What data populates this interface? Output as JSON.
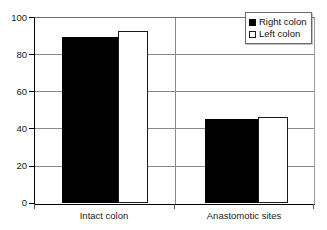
{
  "chart_data": {
    "type": "bar",
    "title": "",
    "xlabel": "",
    "ylabel": "",
    "categories": [
      "Intact colon",
      "Anastomotic sites"
    ],
    "series": [
      {
        "name": "Right colon",
        "color": "#000000",
        "fill": "solid-black",
        "values": [
          89,
          45
        ]
      },
      {
        "name": "Left colon",
        "color": "#ffffff",
        "fill": "white-outlined",
        "values": [
          92.5,
          46.5
        ]
      }
    ],
    "ylim": [
      0,
      100
    ],
    "yticks": [
      0,
      20,
      40,
      60,
      80,
      100
    ],
    "ytick_labels": [
      "0",
      "20",
      "40",
      "60",
      "80",
      "100"
    ],
    "grid": "horizontal",
    "legend_position": "top-right",
    "legend_entries": [
      "Right colon",
      "Left colon"
    ]
  },
  "axes": {
    "y_labels": [
      "100",
      "80",
      "60",
      "40",
      "20",
      "0"
    ],
    "x_labels": [
      "Intact colon",
      "Anastomotic sites"
    ]
  },
  "legend": {
    "items": [
      {
        "label": "Right colon",
        "swatch": "filled-black-square-icon"
      },
      {
        "label": "Left colon",
        "swatch": "outlined-white-square-icon"
      }
    ]
  },
  "title_sliver": {
    "text": ""
  }
}
